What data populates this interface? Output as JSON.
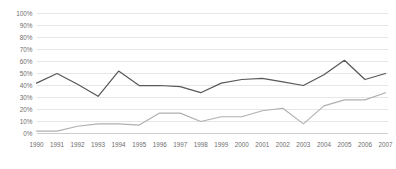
{
  "chart_data": {
    "type": "line",
    "title": "",
    "subtitle": "",
    "xlabel": "",
    "ylabel": "",
    "ylim": [
      0,
      100
    ],
    "ytick_labels": [
      "100%",
      "90%",
      "80%",
      "70%",
      "60%",
      "50%",
      "40%",
      "30%",
      "20%",
      "10%",
      "0%"
    ],
    "ytick_values": [
      100,
      90,
      80,
      70,
      60,
      50,
      40,
      30,
      20,
      10,
      0
    ],
    "grid": true,
    "legend": "none",
    "categories": [
      "1990",
      "1991",
      "1992",
      "1993",
      "1994",
      "1995",
      "1996",
      "1997",
      "1998",
      "1999",
      "2000",
      "2001",
      "2002",
      "2003",
      "2004",
      "2005",
      "2006",
      "2007"
    ],
    "series": [
      {
        "name": "upper-series",
        "color": "#595959",
        "values": [
          42,
          50,
          41,
          31,
          52,
          40,
          40,
          39,
          34,
          42,
          45,
          46,
          43,
          40,
          49,
          61,
          45,
          50
        ]
      },
      {
        "name": "lower-series",
        "color": "#b0b0b0",
        "values": [
          2,
          2,
          6,
          8,
          8,
          7,
          17,
          17,
          10,
          14,
          14,
          19,
          21,
          8,
          23,
          28,
          28,
          34
        ]
      }
    ]
  },
  "axes": {
    "y_axis_name": "percent-axis",
    "x_axis_name": "year-axis"
  }
}
